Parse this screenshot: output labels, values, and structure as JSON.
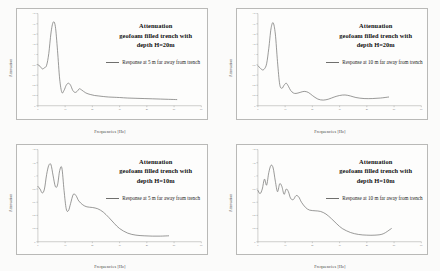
{
  "figure": {
    "background_color": "#fbfbfa",
    "panel_color": "#fdfdfc",
    "curve_color": "#6e6e6c",
    "border_color": "#b9b9b7",
    "panel_count": 4
  },
  "chart_data": [
    {
      "id": "top-left",
      "type": "line",
      "title": "Attenuation",
      "title_line2": "geofoam filled trench with",
      "title_line3": "depth H=20m",
      "xlabel": "Frequencies [Hz]",
      "ylabel": "Attenuation",
      "legend": "Response at 5 m far away from trench",
      "legend_position": "center-right",
      "grid": false,
      "xlim": [
        0,
        60
      ],
      "ylim": [
        0,
        1.8
      ],
      "xticks": [
        0,
        10,
        20,
        30,
        40,
        50,
        60
      ],
      "yticks": [
        0,
        0.2,
        0.4,
        0.6,
        0.8,
        1.0,
        1.2,
        1.4,
        1.6,
        1.8
      ],
      "x": [
        0,
        0.8,
        1.6,
        2.4,
        3.2,
        4.0,
        4.8,
        5.6,
        6.4,
        7.2,
        8.0,
        8.8,
        9.6,
        10.4,
        11.2,
        12.0,
        12.8,
        13.6,
        14.4,
        15.2,
        16.0,
        17.6,
        19.2,
        20.8,
        22.4,
        24.0,
        26.0,
        28.0,
        30.0,
        33.0,
        36.0,
        39.0,
        42.0,
        45.0,
        48.0,
        51.0
      ],
      "y": [
        0.8,
        0.77,
        0.72,
        0.74,
        0.79,
        1.02,
        1.42,
        1.63,
        1.55,
        1.08,
        0.52,
        0.26,
        0.3,
        0.4,
        0.44,
        0.4,
        0.3,
        0.26,
        0.28,
        0.33,
        0.31,
        0.25,
        0.22,
        0.2,
        0.19,
        0.18,
        0.17,
        0.165,
        0.16,
        0.15,
        0.145,
        0.14,
        0.135,
        0.13,
        0.125,
        0.12
      ]
    },
    {
      "id": "top-right",
      "type": "line",
      "title": "Attenuation",
      "title_line2": "geofoam filled trench with",
      "title_line3": "depth H=20m",
      "xlabel": "Frequencies [Hz]",
      "ylabel": "Attenuation",
      "legend": "Response at 10 m far away from trench",
      "legend_position": "center-right",
      "grid": false,
      "xlim": [
        0,
        60
      ],
      "ylim": [
        0,
        1.8
      ],
      "xticks": [
        0,
        10,
        20,
        30,
        40,
        50,
        60
      ],
      "yticks": [
        0,
        0.2,
        0.4,
        0.6,
        0.8,
        1.0,
        1.2,
        1.4,
        1.6,
        1.8
      ],
      "x": [
        0,
        0.8,
        1.6,
        2.4,
        3.2,
        4.0,
        4.8,
        5.6,
        6.4,
        7.2,
        8.0,
        8.8,
        9.6,
        10.4,
        11.2,
        12.0,
        13.0,
        14.0,
        15.5,
        17.0,
        18.5,
        20.0,
        22.0,
        24.0,
        26.0,
        28.0,
        30.0,
        32.0,
        34.0,
        36.0,
        39.0,
        42.0,
        45.0,
        48.0
      ],
      "y": [
        0.78,
        0.74,
        0.7,
        0.72,
        0.82,
        1.12,
        1.5,
        1.62,
        1.4,
        0.86,
        0.42,
        0.34,
        0.4,
        0.44,
        0.38,
        0.3,
        0.25,
        0.24,
        0.26,
        0.28,
        0.26,
        0.2,
        0.13,
        0.11,
        0.13,
        0.17,
        0.2,
        0.21,
        0.19,
        0.16,
        0.14,
        0.14,
        0.15,
        0.17
      ]
    },
    {
      "id": "bottom-left",
      "type": "line",
      "title": "Attenuation",
      "title_line2": "geofoam filled trench with",
      "title_line3": "depth H=10m",
      "xlabel": "Frequencies [Hz]",
      "ylabel": "Attenuation",
      "legend": "Response at 5 m far away from trench",
      "legend_position": "center-right",
      "grid": false,
      "xlim": [
        0,
        60
      ],
      "ylim": [
        0,
        1.4
      ],
      "xticks": [
        0,
        10,
        20,
        30,
        40,
        50,
        60
      ],
      "yticks": [
        0,
        0.2,
        0.4,
        0.6,
        0.8,
        1.0,
        1.2,
        1.4
      ],
      "x": [
        0,
        0.8,
        1.6,
        2.4,
        3.2,
        4.0,
        4.8,
        5.6,
        6.4,
        7.2,
        8.0,
        8.8,
        9.6,
        10.4,
        11.2,
        12.0,
        13.0,
        14.0,
        15.0,
        16.5,
        18.0,
        20.0,
        22.0,
        24.0,
        26.0,
        28.0,
        30.0,
        33.0,
        36.0,
        39.0,
        42.0,
        45.0,
        48.0
      ],
      "y": [
        0.84,
        0.8,
        0.74,
        0.8,
        1.02,
        1.16,
        1.17,
        1.0,
        0.84,
        0.86,
        1.08,
        1.12,
        0.78,
        0.5,
        0.47,
        0.58,
        0.72,
        0.7,
        0.62,
        0.56,
        0.53,
        0.52,
        0.5,
        0.45,
        0.37,
        0.28,
        0.2,
        0.13,
        0.1,
        0.09,
        0.085,
        0.085,
        0.09
      ]
    },
    {
      "id": "bottom-right",
      "type": "line",
      "title": "Attenuation",
      "title_line2": "geofoam filled trench with",
      "title_line3": "depth H=10m",
      "xlabel": "Frequencies [Hz]",
      "ylabel": "Attenuation",
      "legend": "Response at 10 m far away from trench",
      "legend_position": "center-right",
      "grid": false,
      "xlim": [
        0,
        60
      ],
      "ylim": [
        0,
        1.4
      ],
      "xticks": [
        0,
        10,
        20,
        30,
        40,
        50,
        60
      ],
      "yticks": [
        0,
        0.2,
        0.4,
        0.6,
        0.8,
        1.0,
        1.2,
        1.4
      ],
      "x": [
        0,
        0.8,
        1.6,
        2.4,
        3.2,
        4.0,
        4.8,
        5.6,
        6.4,
        7.2,
        8.0,
        8.8,
        9.6,
        10.4,
        11.2,
        12.0,
        13.0,
        14.0,
        15.0,
        16.0,
        17.5,
        19.0,
        21.0,
        23.0,
        25.0,
        27.0,
        29.0,
        31.0,
        34.0,
        37.0,
        40.0,
        43.0,
        46.0,
        49.0
      ],
      "y": [
        0.78,
        0.73,
        0.8,
        0.95,
        0.86,
        1.05,
        1.16,
        1.12,
        0.92,
        0.76,
        0.88,
        0.84,
        0.72,
        0.8,
        0.76,
        0.66,
        0.64,
        0.7,
        0.68,
        0.6,
        0.52,
        0.48,
        0.47,
        0.46,
        0.42,
        0.35,
        0.27,
        0.2,
        0.14,
        0.11,
        0.1,
        0.1,
        0.12,
        0.2
      ]
    }
  ]
}
